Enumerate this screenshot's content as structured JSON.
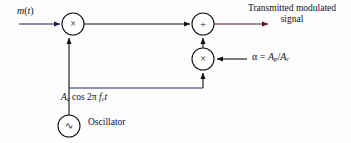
{
  "diagram": {
    "background_color": "#fdfdfd",
    "line_colors": {
      "input_signal": "#1a1a4d",
      "output_signal": "#4d1a22",
      "carrier_branch": "#1d2f66",
      "generic": "#101018"
    }
  },
  "labels": {
    "input_signal": "m(t)",
    "input_signal_base": "m",
    "input_signal_paren_open": "(",
    "input_signal_var": "t",
    "input_signal_paren_close": ")",
    "output_line1": "Transmitted modulated",
    "output_line2": "signal",
    "alpha_symbol": "α",
    "alpha_equals": " = ",
    "alpha_numerator": "A",
    "alpha_numerator_sub": "p",
    "alpha_slash": "/",
    "alpha_denominator": "A",
    "alpha_denominator_sub": "c",
    "carrier_amp": "A",
    "carrier_amp_sub": "c",
    "carrier_cos": " cos 2",
    "carrier_pi": "π",
    "carrier_freq": " f",
    "carrier_freq_sub": "c",
    "carrier_time": "t",
    "oscillator": "Oscillator"
  },
  "nodes": {
    "multiplier_1": {
      "glyph": "×",
      "name": "multiplier",
      "cx": 73,
      "cy": 24,
      "r": 11
    },
    "summer": {
      "glyph": "+",
      "name": "summing-junction",
      "cx": 203,
      "cy": 24,
      "r": 11
    },
    "multiplier_2": {
      "glyph": "×",
      "name": "multiplier",
      "cx": 203,
      "cy": 59,
      "r": 11
    },
    "oscillator": {
      "glyph": "∿",
      "name": "oscillator",
      "cx": 69,
      "cy": 126,
      "r": 11
    }
  },
  "connections": [
    {
      "name": "input-to-multiplier1",
      "from": "m(t) input",
      "to": "multiplier_1"
    },
    {
      "name": "multiplier1-to-summer",
      "from": "multiplier_1",
      "to": "summer"
    },
    {
      "name": "summer-to-output",
      "from": "summer",
      "to": "Transmitted modulated signal"
    },
    {
      "name": "alpha-to-multiplier2",
      "from": "α = A_p/A_c",
      "to": "multiplier_2"
    },
    {
      "name": "multiplier2-to-summer",
      "from": "multiplier_2",
      "to": "summer"
    },
    {
      "name": "oscillator-to-branch",
      "from": "oscillator",
      "to": "carrier branch"
    },
    {
      "name": "carrier-to-multiplier1",
      "from": "carrier branch",
      "to": "multiplier_1"
    },
    {
      "name": "carrier-to-multiplier2",
      "from": "carrier branch",
      "to": "multiplier_2"
    }
  ]
}
